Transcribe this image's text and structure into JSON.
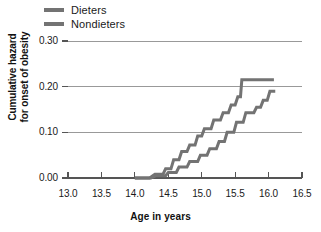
{
  "chart_data": {
    "type": "line",
    "subtype": "step-cumulative-hazard",
    "title": "",
    "xlabel": "Age in years",
    "ylabel_line1": "Cumulative hazard",
    "ylabel_line2": "for onset of obesity",
    "xlim": [
      13.0,
      16.5
    ],
    "ylim": [
      0.0,
      0.3
    ],
    "xticks": [
      13.0,
      13.5,
      14.0,
      14.5,
      15.0,
      15.5,
      16.0,
      16.5
    ],
    "xtick_labels": [
      "13.0",
      "13.5",
      "14.0",
      "14.5",
      "15.0",
      "15.5",
      "16.0",
      "16.5"
    ],
    "yticks": [
      0.0,
      0.1,
      0.2,
      0.3
    ],
    "ytick_labels": [
      "0.00",
      "0.10",
      "0.20",
      "0.30"
    ],
    "grid": "horizontal",
    "legend_position": "top-left",
    "line_color": "#737373",
    "grid_color": "#999999",
    "axis_color": "#555555",
    "series": [
      {
        "name": "Dieters",
        "color": "#737373",
        "points": [
          [
            14.0,
            0.0
          ],
          [
            14.22,
            0.0
          ],
          [
            14.3,
            0.008
          ],
          [
            14.42,
            0.008
          ],
          [
            14.46,
            0.02
          ],
          [
            14.54,
            0.02
          ],
          [
            14.58,
            0.04
          ],
          [
            14.66,
            0.04
          ],
          [
            14.7,
            0.058
          ],
          [
            14.78,
            0.058
          ],
          [
            14.82,
            0.072
          ],
          [
            14.9,
            0.072
          ],
          [
            14.94,
            0.092
          ],
          [
            15.0,
            0.092
          ],
          [
            15.04,
            0.108
          ],
          [
            15.14,
            0.108
          ],
          [
            15.18,
            0.127
          ],
          [
            15.28,
            0.127
          ],
          [
            15.32,
            0.143
          ],
          [
            15.4,
            0.143
          ],
          [
            15.44,
            0.16
          ],
          [
            15.5,
            0.16
          ],
          [
            15.54,
            0.178
          ],
          [
            15.58,
            0.178
          ],
          [
            15.6,
            0.215
          ],
          [
            16.08,
            0.215
          ]
        ]
      },
      {
        "name": "Nondieters",
        "color": "#737373",
        "points": [
          [
            14.0,
            0.0
          ],
          [
            14.24,
            0.0
          ],
          [
            14.32,
            0.005
          ],
          [
            14.46,
            0.005
          ],
          [
            14.5,
            0.012
          ],
          [
            14.62,
            0.012
          ],
          [
            14.66,
            0.024
          ],
          [
            14.78,
            0.024
          ],
          [
            14.82,
            0.036
          ],
          [
            14.94,
            0.036
          ],
          [
            14.98,
            0.05
          ],
          [
            15.08,
            0.05
          ],
          [
            15.12,
            0.064
          ],
          [
            15.22,
            0.064
          ],
          [
            15.26,
            0.08
          ],
          [
            15.34,
            0.08
          ],
          [
            15.38,
            0.1
          ],
          [
            15.48,
            0.1
          ],
          [
            15.52,
            0.122
          ],
          [
            15.62,
            0.122
          ],
          [
            15.66,
            0.143
          ],
          [
            15.78,
            0.143
          ],
          [
            15.82,
            0.155
          ],
          [
            15.88,
            0.155
          ],
          [
            15.92,
            0.17
          ],
          [
            15.98,
            0.17
          ],
          [
            16.02,
            0.19
          ],
          [
            16.1,
            0.19
          ]
        ]
      }
    ]
  },
  "legend": {
    "items": [
      {
        "label": "Dieters"
      },
      {
        "label": "Nondieters"
      }
    ]
  }
}
